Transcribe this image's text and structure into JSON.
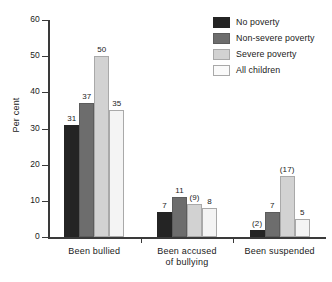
{
  "chart_data": {
    "type": "bar",
    "title": "",
    "xlabel": "",
    "ylabel": "Per cent",
    "ylim": [
      0,
      60
    ],
    "yticks": [
      0,
      10,
      20,
      30,
      40,
      50,
      60
    ],
    "ytick_labels": [
      "0",
      "10",
      "20",
      "30",
      "40",
      "50",
      "60"
    ],
    "grid": false,
    "legend_position": "top-right",
    "categories": [
      "Been bullied",
      "Been accused of bullying",
      "Been suspended"
    ],
    "category_lines": [
      [
        "Been bullied"
      ],
      [
        "Been accused",
        "of bullying"
      ],
      [
        "Been suspended"
      ]
    ],
    "series": [
      {
        "name": "No poverty",
        "color": "#242424",
        "values": [
          31,
          7,
          2
        ],
        "labels": [
          "31",
          "7",
          "(2)"
        ]
      },
      {
        "name": "Non-severe poverty",
        "color": "#6d6d6d",
        "values": [
          37,
          11,
          7
        ],
        "labels": [
          "37",
          "11",
          "7"
        ]
      },
      {
        "name": "Severe poverty",
        "color": "#d2d2d2",
        "values": [
          50,
          9,
          17
        ],
        "labels": [
          "50",
          "(9)",
          "(17)"
        ]
      },
      {
        "name": "All children",
        "color": "#f4f4f4",
        "values": [
          35,
          8,
          5
        ],
        "labels": [
          "35",
          "8",
          "5"
        ]
      }
    ]
  },
  "legend": {
    "items": [
      {
        "label": "No poverty"
      },
      {
        "label": "Non-severe poverty"
      },
      {
        "label": "Severe poverty"
      },
      {
        "label": "All children"
      }
    ]
  },
  "axis": {
    "y_title": "Per cent"
  }
}
